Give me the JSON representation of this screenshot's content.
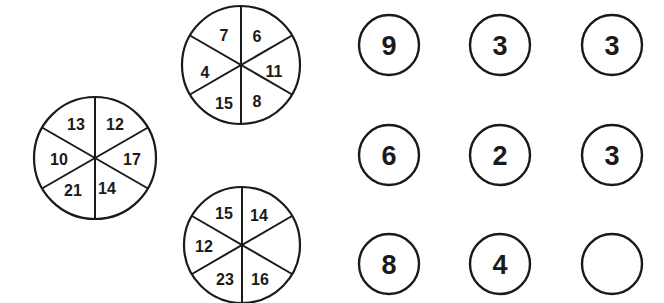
{
  "puzzle": {
    "colors": {
      "ink": "#1a1a1a",
      "background": "#ffffff"
    },
    "wheels": [
      {
        "id": "top-wheel",
        "cx": 241,
        "cy": 65,
        "r": 59,
        "segments": {
          "top_left": "7",
          "top_right": "6",
          "right": "11",
          "bottom_right": "8",
          "bottom_left": "15",
          "left": "4"
        }
      },
      {
        "id": "left-wheel",
        "cx": 95,
        "cy": 158,
        "r": 61,
        "segments": {
          "top_left": "13",
          "top_right": "12",
          "right": "17",
          "bottom_right": "14",
          "bottom_left": "21",
          "left": "10"
        }
      },
      {
        "id": "bottom-wheel",
        "cx": 242,
        "cy": 245,
        "r": 58,
        "segments": {
          "top_left": "15",
          "top_right": "14",
          "right": "",
          "bottom_right": "16",
          "bottom_left": "23",
          "left": "12"
        }
      }
    ],
    "grid": {
      "rows": [
        [
          "9",
          "3",
          "3"
        ],
        [
          "6",
          "2",
          "3"
        ],
        [
          "8",
          "4",
          ""
        ]
      ],
      "col_x": [
        389,
        500,
        612
      ],
      "row_y": [
        45,
        155,
        264
      ],
      "r": 30
    }
  }
}
